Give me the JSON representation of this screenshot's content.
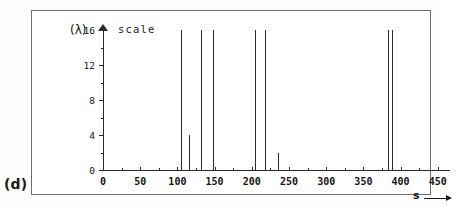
{
  "figure": {
    "panel_label": "(d)",
    "y_axis_title": "(λ)",
    "scale_label": "scale",
    "x_axis_title": "s"
  },
  "chart_data": {
    "type": "bar",
    "title": "",
    "subtitle": "",
    "xlabel": "s",
    "ylabel": "(λ)",
    "annotations": [
      "scale",
      "(d)"
    ],
    "grid": false,
    "legend": null,
    "xlim": [
      0,
      465
    ],
    "ylim": [
      0,
      17
    ],
    "x_ticks": [
      0,
      50,
      100,
      150,
      200,
      250,
      300,
      350,
      400,
      450
    ],
    "x_tick_labels": [
      "0",
      "50",
      "100",
      "150",
      "200",
      "250",
      "300",
      "350",
      "400",
      "450"
    ],
    "x_minor_ticks": [
      25,
      75,
      125,
      175,
      225,
      275,
      325,
      375,
      425
    ],
    "y_ticks": [
      0,
      4,
      8,
      12,
      16
    ],
    "y_tick_labels": [
      "0",
      "4",
      "8",
      "12",
      "16"
    ],
    "y_minor_ticks": [
      2,
      6,
      10,
      14
    ],
    "x": [
      105,
      115,
      132,
      148,
      204,
      218,
      235,
      383,
      389
    ],
    "values": [
      16,
      4,
      16,
      16,
      16,
      16,
      2,
      16,
      16
    ],
    "series": [
      {
        "name": "scale",
        "points": [
          {
            "s": 105,
            "scale": 16
          },
          {
            "s": 115,
            "scale": 4
          },
          {
            "s": 132,
            "scale": 16
          },
          {
            "s": 148,
            "scale": 16
          },
          {
            "s": 204,
            "scale": 16
          },
          {
            "s": 218,
            "scale": 16
          },
          {
            "s": 235,
            "scale": 2
          },
          {
            "s": 383,
            "scale": 16
          },
          {
            "s": 389,
            "scale": 16
          }
        ]
      }
    ]
  }
}
